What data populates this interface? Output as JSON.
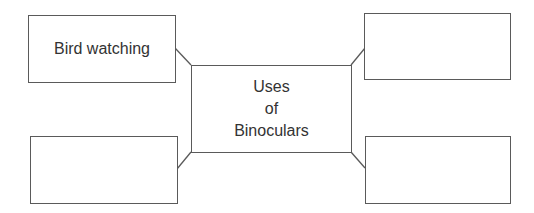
{
  "diagram": {
    "type": "mind-map",
    "center": {
      "lines": [
        "Uses",
        "of",
        "Binoculars"
      ]
    },
    "branches": [
      {
        "position": "top-left",
        "label": "Bird watching"
      },
      {
        "position": "top-right",
        "label": ""
      },
      {
        "position": "bottom-left",
        "label": ""
      },
      {
        "position": "bottom-right",
        "label": ""
      }
    ],
    "colors": {
      "border": "#5a5a5a",
      "text": "#333333",
      "background": "#ffffff"
    }
  }
}
